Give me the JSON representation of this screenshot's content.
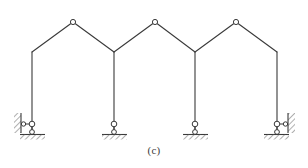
{
  "figure": {
    "caption": "(c)",
    "width": 308,
    "height": 168,
    "background_color": "#ffffff",
    "line_color": "#3a3a3a",
    "hatch_color": "#6e6e6e",
    "joint_fill_color": "#ffffff",
    "line_width": 1.1
  },
  "chart_data": {
    "type": "diagram",
    "units": "pixels",
    "xlim": [
      0,
      308
    ],
    "ylim": [
      0,
      168
    ],
    "grid": false,
    "legend": null,
    "nodes": [
      {
        "id": "base-left",
        "label": "left exterior support",
        "x": 32,
        "y": 131,
        "kind": "link-support"
      },
      {
        "id": "knee-left",
        "label": "left knee joint",
        "x": 32,
        "y": 52,
        "kind": "rigid"
      },
      {
        "id": "apex-1",
        "label": "apex hinge 1",
        "x": 73,
        "y": 22,
        "kind": "hinge"
      },
      {
        "id": "valley-1",
        "label": "valley joint 1",
        "x": 114,
        "y": 52,
        "kind": "rigid"
      },
      {
        "id": "base-interior-1",
        "label": "interior support 1",
        "x": 114,
        "y": 131,
        "kind": "pin-roller"
      },
      {
        "id": "apex-2",
        "label": "apex hinge 2",
        "x": 155,
        "y": 22,
        "kind": "hinge"
      },
      {
        "id": "valley-2",
        "label": "valley joint 2",
        "x": 195,
        "y": 52,
        "kind": "rigid"
      },
      {
        "id": "base-interior-2",
        "label": "interior support 2",
        "x": 195,
        "y": 131,
        "kind": "pin-roller"
      },
      {
        "id": "apex-3",
        "label": "apex hinge 3",
        "x": 236,
        "y": 22,
        "kind": "hinge"
      },
      {
        "id": "knee-right",
        "label": "right knee joint",
        "x": 277,
        "y": 52,
        "kind": "rigid"
      },
      {
        "id": "base-right",
        "label": "right exterior support",
        "x": 277,
        "y": 131,
        "kind": "link-support"
      }
    ],
    "members": [
      {
        "id": "column-left",
        "from": "base-left",
        "to": "knee-left",
        "kind": "column"
      },
      {
        "id": "rafter-1",
        "from": "knee-left",
        "to": "apex-1",
        "kind": "rafter"
      },
      {
        "id": "rafter-2",
        "from": "apex-1",
        "to": "valley-1",
        "kind": "rafter"
      },
      {
        "id": "column-int-1",
        "from": "valley-1",
        "to": "base-interior-1",
        "kind": "column"
      },
      {
        "id": "rafter-3",
        "from": "valley-1",
        "to": "apex-2",
        "kind": "rafter"
      },
      {
        "id": "rafter-4",
        "from": "apex-2",
        "to": "valley-2",
        "kind": "rafter"
      },
      {
        "id": "column-int-2",
        "from": "valley-2",
        "to": "base-interior-2",
        "kind": "column"
      },
      {
        "id": "rafter-5",
        "from": "valley-2",
        "to": "apex-3",
        "kind": "rafter"
      },
      {
        "id": "rafter-6",
        "from": "apex-3",
        "to": "knee-right",
        "kind": "rafter"
      },
      {
        "id": "column-right",
        "from": "knee-right",
        "to": "base-right",
        "kind": "column"
      }
    ],
    "hinge_count": 3,
    "support_count": 4,
    "bay_count": 3
  }
}
